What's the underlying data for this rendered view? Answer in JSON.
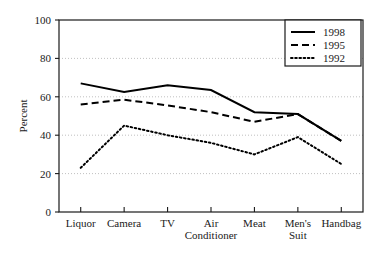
{
  "chart_data": {
    "type": "line",
    "title": "",
    "xlabel": "",
    "ylabel": "Percent",
    "ylim": [
      0,
      100
    ],
    "yticks": [
      0,
      20,
      40,
      60,
      80,
      100
    ],
    "ytick_labels": [
      "0",
      "20",
      "40",
      "60",
      "80",
      "100"
    ],
    "grid": true,
    "grid_style": "dotted-horizontal",
    "legend_position": "top-right",
    "categories": [
      "Liquor",
      "Camera",
      "TV",
      "Air Conditioner",
      "Meat",
      "Men's Suit",
      "Handbag"
    ],
    "category_label_lines": [
      [
        "Liquor"
      ],
      [
        "Camera"
      ],
      [
        "TV"
      ],
      [
        "Air",
        "Conditioner"
      ],
      [
        "Meat"
      ],
      [
        "Men's",
        "Suit"
      ],
      [
        "Handbag"
      ]
    ],
    "series": [
      {
        "name": "1998",
        "style": "solid",
        "color": "#000000",
        "values": [
          67,
          62.5,
          66,
          63.5,
          52,
          51,
          37
        ]
      },
      {
        "name": "1995",
        "style": "dashed",
        "color": "#000000",
        "values": [
          56,
          58.5,
          55.5,
          52,
          47,
          51,
          37
        ]
      },
      {
        "name": "1992",
        "style": "dotted",
        "color": "#000000",
        "values": [
          23,
          45,
          40,
          36,
          30,
          39,
          25
        ]
      }
    ]
  },
  "legend": {
    "entries": [
      {
        "label": "1998"
      },
      {
        "label": "1995"
      },
      {
        "label": "1992"
      }
    ]
  },
  "colors": {
    "background": "#ffffff",
    "axis": "#1a1a1a",
    "grid": "#b0b0b0",
    "series": "#000000"
  }
}
